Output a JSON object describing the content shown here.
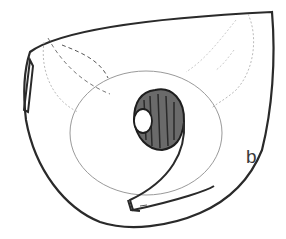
{
  "figure": {
    "panel_label": "b",
    "colors": {
      "ink": "#2a2a2a",
      "faint": "#b8b8b8",
      "background": "#ffffff"
    }
  }
}
